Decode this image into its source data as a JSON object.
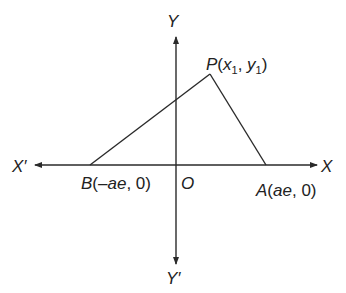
{
  "diagram": {
    "type": "coordinate-geometry",
    "axes": {
      "x_positive_label": "X",
      "x_negative_label": "X′",
      "y_positive_label": "Y",
      "y_negative_label": "Y′",
      "origin_label": "O"
    },
    "points": {
      "P": {
        "name": "P",
        "open": "(",
        "x": "x",
        "x_sub": "1",
        "sep": ", ",
        "y": "y",
        "y_sub": "1",
        "close": ")"
      },
      "A": {
        "name": "A",
        "coords": "(ae, 0)",
        "open": "(",
        "x": "ae",
        "sep": ", ",
        "y": "0",
        "close": ")"
      },
      "B": {
        "name": "B",
        "coords": "(−ae, 0)",
        "open": "(",
        "x": "–ae",
        "sep": ", ",
        "y": "0",
        "close": ")"
      }
    },
    "segments": [
      "BP",
      "PA",
      "BA"
    ],
    "colors": {
      "stroke": "#2a2a2a",
      "text": "#222222",
      "background": "#ffffff"
    }
  }
}
